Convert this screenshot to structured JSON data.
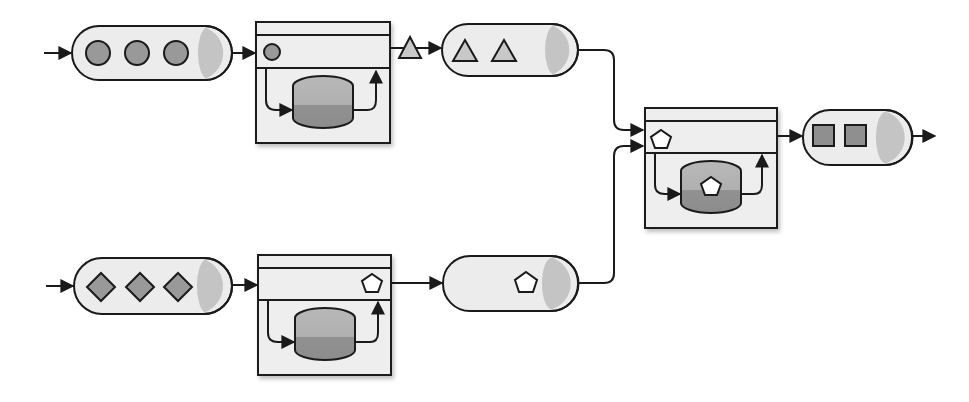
{
  "diagram": {
    "colors": {
      "stroke": "#1a1a1a",
      "queue_fill": "#ececec",
      "queue_cap": "#c4c4c4",
      "box_fill": "#eeeeee",
      "store_top": "#b4b4b4",
      "store_bottom": "#8f8f8f",
      "token_fill": "#999999",
      "triangle_fill": "#c8c8c8",
      "pentagon_fill": "#ffffff"
    },
    "streams": [
      {
        "id": "input-a",
        "token": "circle",
        "count": 3
      },
      {
        "id": "input-b",
        "token": "diamond",
        "count": 3
      },
      {
        "id": "intermediate-a",
        "token": "triangle",
        "count": 2
      },
      {
        "id": "intermediate-b",
        "token": "pentagon",
        "count": 1
      },
      {
        "id": "output",
        "token": "square",
        "count": 2
      }
    ],
    "processors": [
      {
        "id": "processor-a",
        "input_token": "circle",
        "output_token": "triangle",
        "has_state_store": true
      },
      {
        "id": "processor-b",
        "input_token": "diamond",
        "output_token": "pentagon",
        "has_state_store": true
      },
      {
        "id": "join-processor",
        "input_token": "pentagon",
        "stored_token": "pentagon",
        "output_token": "square",
        "has_state_store": true
      }
    ]
  }
}
